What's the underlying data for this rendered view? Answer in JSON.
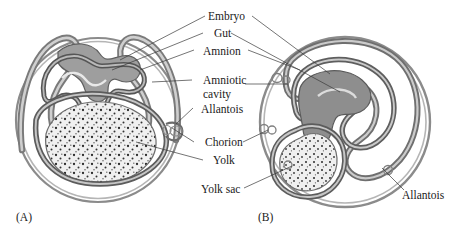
{
  "figure": {
    "panels": [
      {
        "id": "A",
        "caption": "(A)",
        "x": 16,
        "y": 212
      },
      {
        "id": "B",
        "caption": "(B)",
        "x": 258,
        "y": 212
      }
    ]
  },
  "labels": [
    {
      "key": "embryo",
      "text": "Embryo",
      "x": 208,
      "y": 10,
      "anchor": "middle"
    },
    {
      "key": "gut",
      "text": "Gut",
      "x": 214,
      "y": 27,
      "anchor": "middle"
    },
    {
      "key": "amnion",
      "text": "Amnion",
      "x": 208,
      "y": 45,
      "anchor": "middle"
    },
    {
      "key": "amniotic",
      "text": "Amniotic",
      "x": 207,
      "y": 74,
      "anchor": "middle"
    },
    {
      "key": "cavity",
      "text": "cavity",
      "x": 207,
      "y": 88,
      "anchor": "middle"
    },
    {
      "key": "allantois",
      "text": "Allantois",
      "x": 205,
      "y": 105,
      "anchor": "middle"
    },
    {
      "key": "chorion",
      "text": "Chorion",
      "x": 210,
      "y": 140,
      "anchor": "middle"
    },
    {
      "key": "yolk",
      "text": "Yolk",
      "x": 216,
      "y": 159,
      "anchor": "middle"
    },
    {
      "key": "yolk_sac",
      "text": "Yolk sac",
      "x": 226,
      "y": 189,
      "anchor": "middle"
    },
    {
      "key": "allantois_right",
      "text": "Allantois",
      "x": 402,
      "y": 194,
      "anchor": "start"
    }
  ],
  "colors": {
    "background": "#ffffff",
    "ink": "#1a1a1a",
    "membrane_dark": "#6e6e6e",
    "membrane_mid": "#8f8f8f",
    "membrane_light": "#c3c3c3",
    "embryo_fill": "#9a9a9a",
    "yolk_fill": "#efefef",
    "yolk_speck": "#2b2b2b",
    "leader_line": "#3a3a3a"
  },
  "structures": {
    "panel_a": {
      "chorion": "outer thin double circle",
      "amnion": "dark folded membrane over embryo",
      "embryo": "small gray folded embryo at top",
      "yolk": "large speckled oval filling lower half",
      "allantois": "small pocket at right margin"
    },
    "panel_b": {
      "chorion": "outer thin double circle",
      "amnion": "inner folded membrane enclosing amniotic cavity",
      "embryo": "gray C-shaped embryo with gut loop",
      "yolk_sac": "speckled sac at lower left",
      "allantois": "large expanded sac filling right side"
    }
  },
  "leaders": [
    {
      "from": "embryo",
      "to_panel": "A"
    },
    {
      "from": "embryo",
      "to_panel": "B"
    },
    {
      "from": "gut",
      "to_panel": "A"
    },
    {
      "from": "gut",
      "to_panel": "B"
    },
    {
      "from": "amnion",
      "to_panel": "A"
    },
    {
      "from": "amnion",
      "to_panel": "B"
    },
    {
      "from": "amniotic",
      "to_panel": "A"
    },
    {
      "from": "amniotic",
      "to_panel": "B"
    },
    {
      "from": "allantois",
      "to_panel": "A"
    },
    {
      "from": "chorion",
      "to_panel": "A"
    },
    {
      "from": "chorion",
      "to_panel": "B"
    },
    {
      "from": "yolk",
      "to_panel": "A"
    },
    {
      "from": "yolk_sac",
      "to_panel": "B"
    },
    {
      "from": "allantois_right",
      "to_panel": "B"
    }
  ]
}
